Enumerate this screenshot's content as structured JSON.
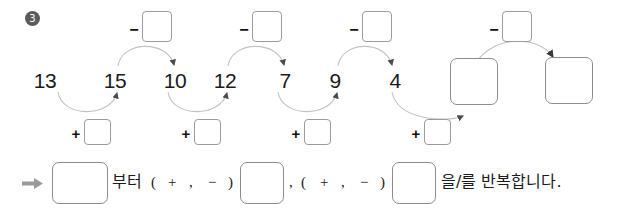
{
  "problem": {
    "number": "3"
  },
  "chain": {
    "numbers": [
      "13",
      "15",
      "10",
      "12",
      "7",
      "9",
      "4"
    ],
    "minus_sign": "−",
    "plus_sign": "+",
    "minus_boxes": [
      "",
      "",
      "",
      ""
    ],
    "plus_boxes": [
      "",
      "",
      "",
      ""
    ],
    "result_boxes": [
      "",
      ""
    ]
  },
  "sentence": {
    "arrow_icon": "right-arrow-icon",
    "box1": "",
    "text1": "부터",
    "paren_open_1": "(",
    "plus_1": "+",
    "comma_1": ",",
    "minus_1": "−",
    "paren_close_1": ")",
    "box2": "",
    "comma_mid": ",",
    "paren_open_2": "(",
    "plus_2": "+",
    "comma_2": ",",
    "minus_2": "−",
    "paren_close_2": ")",
    "box3": "",
    "text2": "을/를 반복합니다."
  },
  "colors": {
    "box_border": "#9b9b9b",
    "arc": "#b8b8b8",
    "text": "#1a1a1a",
    "bullet_bg": "#5a5a5a",
    "arrow": "#9a9a9a"
  }
}
